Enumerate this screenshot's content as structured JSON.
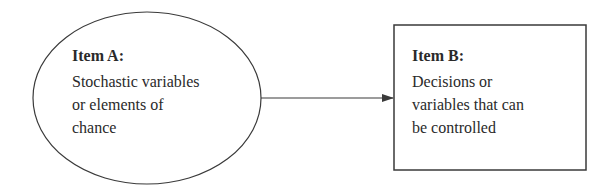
{
  "diagram": {
    "nodes": [
      {
        "id": "item-a",
        "shape": "ellipse",
        "title": "Item A:",
        "lines": [
          "Stochastic variables",
          "or elements of",
          "chance"
        ]
      },
      {
        "id": "item-b",
        "shape": "rectangle",
        "title": "Item B:",
        "lines": [
          "Decisions or",
          "variables that can",
          "be controlled"
        ]
      }
    ],
    "edges": [
      {
        "from": "item-a",
        "to": "item-b",
        "type": "arrow"
      }
    ],
    "colors": {
      "stroke": "#3a3a3a",
      "text": "#2a2a2a",
      "background": "#ffffff"
    }
  }
}
